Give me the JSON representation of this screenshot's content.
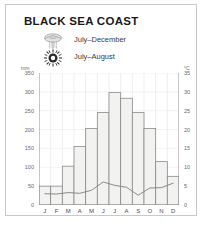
{
  "frame": {
    "border_color": "#c9c9c9",
    "background": "#ffffff"
  },
  "title": "BLACK SEA COAST",
  "legend": {
    "items": [
      {
        "icon": "jellyfish-icon",
        "label": "July–December"
      },
      {
        "icon": "sun-icon",
        "label": "July–August"
      }
    ]
  },
  "axes": {
    "left_unit": "mm",
    "right_unit": "°C"
  },
  "chart_data": {
    "type": "bar",
    "title": "BLACK SEA COAST",
    "xlabel": "",
    "ylabel": "mm",
    "categories": [
      "J",
      "F",
      "M",
      "A",
      "M",
      "J",
      "J",
      "A",
      "S",
      "O",
      "N",
      "D"
    ],
    "month_names": [
      "January",
      "February",
      "March",
      "April",
      "May",
      "June",
      "July",
      "August",
      "September",
      "October",
      "November",
      "December"
    ],
    "grid": true,
    "legend_position": "top-left",
    "series": [
      {
        "name": "Precipitation",
        "type": "bar",
        "unit": "mm",
        "axis": "left",
        "values": [
          50,
          50,
          103,
          155,
          203,
          245,
          298,
          283,
          245,
          203,
          115,
          76
        ],
        "color": "#f2f2f0",
        "edge_color": "#8a8a8a"
      },
      {
        "name": "Temperature",
        "type": "line",
        "unit": "°C",
        "axis": "right",
        "values": [
          3.0,
          2.9,
          3.3,
          3.1,
          3.9,
          6.1,
          5.2,
          4.7,
          2.6,
          4.5,
          4.6,
          5.8
        ],
        "color": "#8a8a8a"
      }
    ],
    "left_axis": {
      "label": "mm",
      "min": 0,
      "max": 350,
      "step": 50,
      "ticks": [
        0,
        50,
        100,
        150,
        200,
        250,
        300,
        350
      ]
    },
    "right_axis": {
      "label": "°C",
      "min": 0,
      "max": 35,
      "step": 5,
      "ticks": [
        0,
        5,
        10,
        15,
        20,
        25,
        30,
        35
      ]
    }
  }
}
